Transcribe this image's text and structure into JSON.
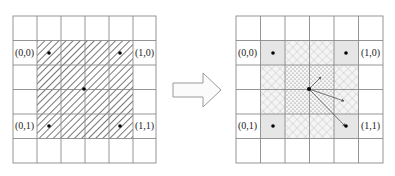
{
  "left_grid": {
    "origin": [
      13,
      16
    ],
    "cell": 24,
    "rows": 6,
    "cols": 6,
    "hatched_region": {
      "col_start": 1,
      "row_start": 1,
      "col_end": 5,
      "row_end": 5
    },
    "labels": {
      "top_left": "(0,0)",
      "top_right": "(1,0)",
      "bottom_left": "(0,1)",
      "bottom_right": "(1,1)"
    }
  },
  "right_grid": {
    "origin": [
      236,
      16
    ],
    "cell": 24.5,
    "rows": 6,
    "cols": 6,
    "labels": {
      "top_left": "(0,0)",
      "top_right": "(1,0)",
      "bottom_left": "(0,1)",
      "bottom_right": "(1,1)"
    }
  },
  "arrow": {
    "direction": "right"
  },
  "colors": {
    "grid_line": "#8a8a8a",
    "hatch": "#555555",
    "corner_fill": "#e4e4e4",
    "crosshatch": "#bdbdbd",
    "dots": "#666666",
    "point": "#000000",
    "arrow_outline": "#9a9a9a"
  }
}
